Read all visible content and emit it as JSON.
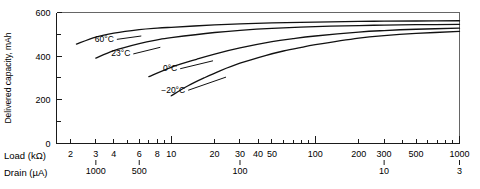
{
  "chart_data": {
    "type": "line",
    "title": "",
    "subtitle": "",
    "ylabel": "Delivered capacity, mAh",
    "xlabel": "Load (kΩ)",
    "xlabel2": "Drain (µA)",
    "ylim": [
      0,
      600
    ],
    "y_major_ticks": [
      0,
      200,
      400,
      600
    ],
    "y_major_tick_labels": [
      "0",
      "200",
      "400",
      "600"
    ],
    "y_minor_ticks": [
      100,
      300,
      500
    ],
    "grid": false,
    "x_scale": "log",
    "xlim": [
      1.6,
      1000
    ],
    "x_tick_values": [
      2,
      3,
      4,
      6,
      8,
      10,
      20,
      30,
      40,
      50,
      100,
      200,
      300,
      500,
      1000
    ],
    "x_tick_labels": [
      "2",
      "3",
      "4",
      "6",
      "8",
      "10",
      "20",
      "30",
      "40",
      "50",
      "100",
      "200",
      "300",
      "500",
      "1000"
    ],
    "x_minor_tick_values": [
      5,
      7,
      9,
      60,
      70,
      80,
      90,
      400,
      600,
      700,
      800,
      900
    ],
    "drain_tick_values": [
      3,
      6,
      30,
      300,
      1000
    ],
    "drain_tick_labels": [
      "1000",
      "500",
      "100",
      "10",
      "3"
    ],
    "legend_position": "inline-annotations",
    "series": [
      {
        "name": "60°C",
        "label": "60°C",
        "label_x": 4.0,
        "label_y": 465,
        "leader_to_x": 6.2,
        "leader_to_y": 492,
        "points": [
          [
            2.2,
            455
          ],
          [
            3,
            487
          ],
          [
            4,
            505
          ],
          [
            6,
            521
          ],
          [
            8,
            528
          ],
          [
            10,
            532
          ],
          [
            20,
            543
          ],
          [
            30,
            548
          ],
          [
            50,
            552
          ],
          [
            100,
            556
          ],
          [
            200,
            559
          ],
          [
            300,
            560
          ],
          [
            500,
            561
          ],
          [
            1000,
            562
          ]
        ]
      },
      {
        "name": "23°C",
        "label": "23°C",
        "label_x": 5.2,
        "label_y": 398,
        "leader_to_x": 8.4,
        "leader_to_y": 440,
        "points": [
          [
            3.0,
            390
          ],
          [
            4,
            425
          ],
          [
            6,
            457
          ],
          [
            8,
            474
          ],
          [
            10,
            484
          ],
          [
            20,
            508
          ],
          [
            30,
            518
          ],
          [
            50,
            527
          ],
          [
            100,
            535
          ],
          [
            200,
            540
          ],
          [
            300,
            542
          ],
          [
            500,
            544
          ],
          [
            1000,
            545
          ]
        ]
      },
      {
        "name": "0°C",
        "label": "0°C",
        "label_x": 11.0,
        "label_y": 330,
        "leader_to_x": 19.5,
        "leader_to_y": 378,
        "points": [
          [
            7.0,
            305
          ],
          [
            10,
            348
          ],
          [
            15,
            385
          ],
          [
            20,
            409
          ],
          [
            30,
            437
          ],
          [
            50,
            466
          ],
          [
            70,
            480
          ],
          [
            100,
            492
          ],
          [
            200,
            510
          ],
          [
            300,
            517
          ],
          [
            500,
            523
          ],
          [
            1000,
            528
          ]
        ]
      },
      {
        "name": "−20°C",
        "label": "−20°C",
        "label_x": 12.5,
        "label_y": 231,
        "leader_to_x": 24.0,
        "leader_to_y": 303,
        "points": [
          [
            10.0,
            217
          ],
          [
            13,
            262
          ],
          [
            17,
            300
          ],
          [
            22,
            333
          ],
          [
            30,
            367
          ],
          [
            45,
            402
          ],
          [
            60,
            423
          ],
          [
            80,
            440
          ],
          [
            100,
            452
          ],
          [
            200,
            482
          ],
          [
            300,
            494
          ],
          [
            500,
            504
          ],
          [
            1000,
            513
          ]
        ]
      }
    ]
  },
  "axes": {
    "y_title": "Delivered capacity, mAh",
    "x_row1_title": "Load (kΩ)",
    "x_row2_title": "Drain (µA)"
  },
  "colors": {
    "curve": "#111111",
    "axis": "#1a1a1a",
    "frame": "#555555",
    "background": "#ffffff",
    "text": "#000000"
  }
}
